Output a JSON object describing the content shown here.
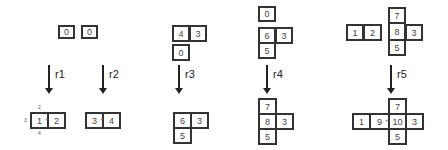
{
  "rules": [
    {
      "label": "r1",
      "before": [
        {
          "v": "0"
        },
        {
          "v": "0"
        }
      ],
      "after": [
        {
          "v": "1"
        },
        {
          "v": "2"
        }
      ],
      "after_ports": {
        "top": "2",
        "left": "3",
        "bottom": "4"
      }
    },
    {
      "label": "r2",
      "after": [
        {
          "v": "3"
        },
        {
          "v": "4"
        }
      ]
    },
    {
      "label": "r3",
      "before": [
        {
          "v": "4"
        },
        {
          "v": "3"
        },
        {
          "v": "0"
        }
      ],
      "after": [
        {
          "v": "6"
        },
        {
          "v": "3"
        },
        {
          "v": "5"
        }
      ]
    },
    {
      "label": "r4",
      "before": [
        {
          "v": "0"
        },
        {
          "v": "6"
        },
        {
          "v": "3"
        },
        {
          "v": "5"
        }
      ],
      "after": [
        {
          "v": "7"
        },
        {
          "v": "8"
        },
        {
          "v": "3"
        },
        {
          "v": "5"
        }
      ]
    },
    {
      "label": "r5",
      "before": [
        {
          "v": "7"
        },
        {
          "v": "1"
        },
        {
          "v": "2"
        },
        {
          "v": "8"
        },
        {
          "v": "3"
        },
        {
          "v": "5"
        }
      ],
      "after": [
        {
          "v": "7"
        },
        {
          "v": "1"
        },
        {
          "v": "9"
        },
        {
          "v": "10"
        },
        {
          "v": "3"
        },
        {
          "v": "5"
        }
      ]
    }
  ]
}
